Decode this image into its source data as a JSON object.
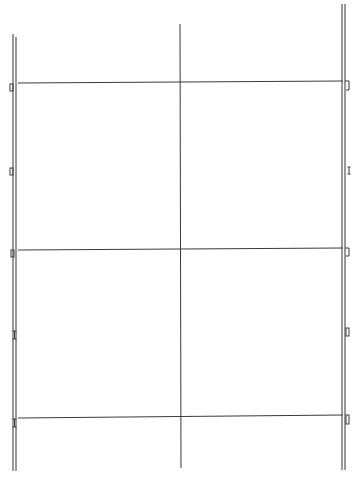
{
  "canvas": {
    "width": 358,
    "height": 480,
    "background": "#ffffff",
    "stroke_color": "#3a3a3a",
    "rail_color": "#555555"
  },
  "diagram": {
    "rails": [
      {
        "name": "left-rail",
        "lines": [
          {
            "x1": 13,
            "y1": 34,
            "x2": 13,
            "y2": 471
          },
          {
            "x1": 16,
            "y1": 37,
            "x2": 16,
            "y2": 471
          }
        ]
      },
      {
        "name": "right-rail",
        "lines": [
          {
            "x1": 342,
            "y1": 4,
            "x2": 342,
            "y2": 470
          },
          {
            "x1": 345,
            "y1": 4,
            "x2": 345,
            "y2": 470
          }
        ]
      }
    ],
    "center_vertical": {
      "x1": 180,
      "y1": 24,
      "x2": 181,
      "y2": 468
    },
    "horizontals": [
      {
        "name": "top-crossbar",
        "x1": 18,
        "y1": 83,
        "x2": 343,
        "y2": 81
      },
      {
        "name": "middle-crossbar",
        "x1": 18,
        "y1": 250,
        "x2": 343,
        "y2": 248
      },
      {
        "name": "bottom-crossbar",
        "x1": 18,
        "y1": 418,
        "x2": 343,
        "y2": 415
      }
    ],
    "brackets": [
      {
        "name": "left-bracket-top",
        "type": "box",
        "x": 10,
        "y": 84,
        "w": 3,
        "h": 7
      },
      {
        "name": "left-bracket-upper-mid",
        "type": "box",
        "x": 10,
        "y": 168,
        "w": 3,
        "h": 7
      },
      {
        "name": "left-bracket-middle",
        "type": "box",
        "x": 11,
        "y": 250,
        "w": 3,
        "h": 7
      },
      {
        "name": "left-bracket-lower-mid",
        "type": "ibeam",
        "x": 13,
        "y": 331,
        "w": 3,
        "h": 8
      },
      {
        "name": "left-bracket-bottom",
        "type": "ibeam",
        "x": 13,
        "y": 419,
        "w": 3,
        "h": 8
      },
      {
        "name": "right-bracket-top",
        "type": "hook",
        "x": 346,
        "y": 81,
        "w": 3,
        "h": 9
      },
      {
        "name": "right-bracket-upper-mid",
        "type": "ibeam",
        "x": 348,
        "y": 167,
        "w": 2,
        "h": 7
      },
      {
        "name": "right-bracket-middle",
        "type": "hook",
        "x": 346,
        "y": 248,
        "w": 3,
        "h": 8
      },
      {
        "name": "right-bracket-lower-mid",
        "type": "box",
        "x": 346,
        "y": 328,
        "w": 3,
        "h": 8
      },
      {
        "name": "right-bracket-bottom",
        "type": "box",
        "x": 346,
        "y": 415,
        "w": 3,
        "h": 9
      }
    ]
  }
}
